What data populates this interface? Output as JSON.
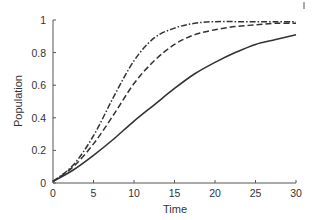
{
  "chart_data": {
    "type": "line",
    "title": "",
    "xlabel": "Time",
    "ylabel": "Population",
    "xlim": [
      0,
      30
    ],
    "ylim": [
      0,
      1
    ],
    "xticks": [
      0,
      5,
      10,
      15,
      20,
      25,
      30
    ],
    "yticks": [
      0,
      0.2,
      0.4,
      0.6,
      0.8,
      1
    ],
    "ytick_labels": [
      "0",
      "0.2",
      "0.4",
      "0.6",
      "0.8",
      "1"
    ],
    "grid": false,
    "legend": null,
    "x": [
      0,
      2.5,
      5,
      7.5,
      10,
      12.5,
      15,
      17.5,
      20,
      22.5,
      25,
      27.5,
      30
    ],
    "series": [
      {
        "name": "solid",
        "style": "solid",
        "color": "#333333",
        "values": [
          0.01,
          0.08,
          0.17,
          0.27,
          0.38,
          0.48,
          0.58,
          0.67,
          0.74,
          0.8,
          0.85,
          0.88,
          0.91
        ]
      },
      {
        "name": "dashed",
        "style": "dashed",
        "color": "#333333",
        "values": [
          0.01,
          0.1,
          0.24,
          0.42,
          0.61,
          0.75,
          0.85,
          0.91,
          0.94,
          0.96,
          0.97,
          0.98,
          0.98
        ]
      },
      {
        "name": "dash-dot",
        "style": "dashdot",
        "color": "#333333",
        "values": [
          0.01,
          0.11,
          0.29,
          0.53,
          0.75,
          0.89,
          0.95,
          0.98,
          0.99,
          0.99,
          0.99,
          0.99,
          0.99
        ]
      }
    ]
  }
}
